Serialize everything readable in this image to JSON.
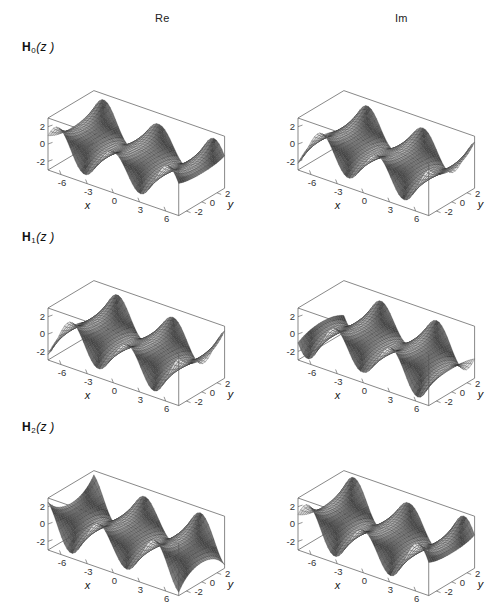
{
  "figure": {
    "width": 503,
    "height": 608,
    "background": "#ffffff",
    "ink": "#1a1a1a"
  },
  "columns": [
    {
      "key": "re",
      "label": "Re"
    },
    {
      "key": "im",
      "label": "Im"
    }
  ],
  "rows": [
    {
      "key": "h0",
      "base": "H",
      "sub": "0",
      "arg": "(z )"
    },
    {
      "key": "h1",
      "base": "H",
      "sub": "1",
      "arg": "(z )"
    },
    {
      "key": "h2",
      "base": "H",
      "sub": "2",
      "arg": "(z )"
    }
  ],
  "axes": {
    "x": {
      "label": "x",
      "ticks": [
        -6,
        -3,
        0,
        3,
        6
      ],
      "tick_labels": [
        "-6",
        "-3",
        "0",
        "3",
        "6"
      ],
      "range": [
        -7.5,
        7.5
      ]
    },
    "y": {
      "label": "y",
      "ticks": [
        -2,
        0,
        2
      ],
      "tick_labels": [
        "-2",
        "0",
        "2"
      ],
      "range": [
        -3,
        3
      ]
    },
    "z": {
      "label": "",
      "ticks": [
        -2,
        0,
        2
      ],
      "tick_labels": [
        "-2",
        "0",
        "2"
      ],
      "range": [
        -3,
        3
      ]
    }
  },
  "chart_data": {
    "type": "surface-grid",
    "title": "",
    "subtitle": "",
    "xlabel": "x",
    "ylabel": "y",
    "zlabel": "",
    "xlim": [
      -7.5,
      7.5
    ],
    "ylim": [
      -3,
      3
    ],
    "zlim": [
      -3,
      3
    ],
    "grid": false,
    "legend": "none",
    "column_headers": [
      "Re",
      "Im"
    ],
    "row_headers": [
      "H_0(z)",
      "H_1(z)",
      "H_2(z)"
    ],
    "projection": {
      "type": "axonometric",
      "azimuth_deg": -52,
      "elevation_deg": 24,
      "x_axis_screen": [
        0.86,
        0.3
      ],
      "y_axis_screen": [
        0.62,
        -0.37
      ],
      "z_axis_screen": [
        0.0,
        -1.0
      ]
    },
    "mesh": {
      "nx": 48,
      "ny": 22,
      "line_color": "#2b2b2b",
      "line_width": 0.28
    },
    "shading": {
      "model": "lambert-gray",
      "light_dir": [
        -0.55,
        0.45,
        0.7
      ],
      "min_gray": "#4a4a4a",
      "max_gray": "#e8e8e8"
    },
    "panels": [
      {
        "row": "h0",
        "column": "re",
        "surface": "Re(StruveH[0, x + i y])",
        "params": {
          "order": 0,
          "part": "re",
          "period": 6.283,
          "amp": 1.25,
          "growth": 0.42,
          "phase": 1.5708,
          "ridges_x": [
            -4.7,
            1.6,
            7.9
          ],
          "valleys_x": [
            -7.85,
            -1.6,
            4.7
          ]
        },
        "z_observed_range": [
          -3.0,
          3.0
        ]
      },
      {
        "row": "h0",
        "column": "im",
        "surface": "Im(StruveH[0, x + i y])",
        "params": {
          "order": 0,
          "part": "im",
          "period": 6.283,
          "amp": 1.25,
          "growth": 0.42,
          "phase": 0.0,
          "ridges_x": [
            -6.3,
            0.0,
            6.3
          ],
          "valleys_x": [
            -3.15,
            3.15
          ]
        },
        "z_observed_range": [
          -3.0,
          3.0
        ]
      },
      {
        "row": "h1",
        "column": "re",
        "surface": "Re(StruveH[1, x + i y])",
        "params": {
          "order": 1,
          "part": "re",
          "period": 6.283,
          "amp": 1.3,
          "growth": 0.45,
          "phase": 0.0,
          "ridges_x": [
            -6.3,
            0.0,
            6.3
          ],
          "valleys_x": [
            -3.15,
            3.15
          ]
        },
        "z_observed_range": [
          -3.0,
          3.0
        ]
      },
      {
        "row": "h1",
        "column": "im",
        "surface": "Im(StruveH[1, x + i y])",
        "params": {
          "order": 1,
          "part": "im",
          "period": 6.283,
          "amp": 1.3,
          "growth": 0.45,
          "phase": -1.5708,
          "ridges_x": [
            -4.7,
            1.6,
            7.9
          ],
          "valleys_x": [
            -7.85,
            -1.6,
            4.7
          ]
        },
        "z_observed_range": [
          -3.0,
          3.0
        ]
      },
      {
        "row": "h2",
        "column": "re",
        "surface": "Re(StruveH[2, x + i y])",
        "params": {
          "order": 2,
          "part": "re",
          "period": 6.283,
          "amp": 1.35,
          "growth": 0.48,
          "phase": 3.1416,
          "ridges_x": [
            -4.7,
            1.6,
            7.9
          ],
          "valleys_x": [
            -7.85,
            -1.6,
            4.7
          ]
        },
        "z_observed_range": [
          -3.0,
          3.0
        ]
      },
      {
        "row": "h2",
        "column": "im",
        "surface": "Im(StruveH[2, x + i y])",
        "params": {
          "order": 2,
          "part": "im",
          "period": 6.283,
          "amp": 1.35,
          "growth": 0.48,
          "phase": 1.5708,
          "ridges_x": [
            -6.3,
            0.0,
            6.3
          ],
          "valleys_x": [
            -3.15,
            3.15
          ]
        },
        "z_observed_range": [
          -3.0,
          3.0
        ]
      }
    ]
  },
  "layout": {
    "panel_width": 232,
    "panel_height": 178,
    "col_x": [
      14,
      264
    ],
    "row_y": [
      16,
      206,
      396
    ],
    "header_y": [
      12,
      12
    ],
    "header_x": [
      155,
      395
    ],
    "row_label_x": [
      22,
      22,
      22
    ],
    "row_label_y": [
      40,
      230,
      420
    ]
  }
}
